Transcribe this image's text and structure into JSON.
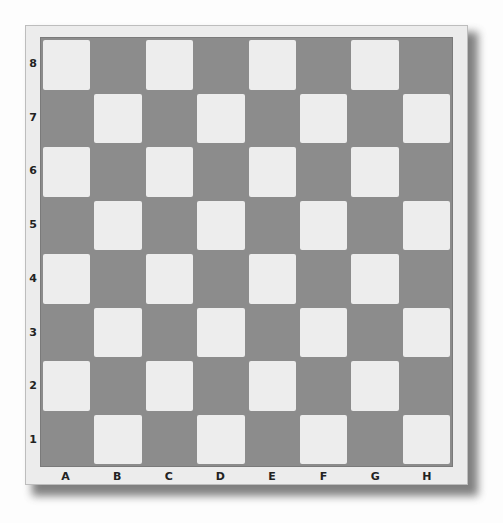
{
  "board": {
    "files": [
      "A",
      "B",
      "C",
      "D",
      "E",
      "F",
      "G",
      "H"
    ],
    "ranks": [
      "8",
      "7",
      "6",
      "5",
      "4",
      "3",
      "2",
      "1"
    ],
    "colors": {
      "dark": "#8c8c8c",
      "light": "#ededed",
      "frame": "#ececec"
    },
    "pieces": []
  }
}
